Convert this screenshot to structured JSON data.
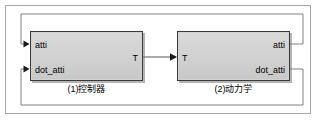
{
  "diagram": {
    "frame": {
      "border_color": "#a8a8a8",
      "background": "#ffffff"
    },
    "block_fill": "#d2d2d2",
    "block_border": "#3a3a3a",
    "line_color": "#808080",
    "signal_line_color": "#555555",
    "blocks": [
      {
        "id": "controller",
        "caption": "(1)控制器",
        "inputs": [
          {
            "name": "atti",
            "label": "atti"
          },
          {
            "name": "dot_atti",
            "label": "dot_atti"
          }
        ],
        "outputs": [
          {
            "name": "T",
            "label": "T"
          }
        ]
      },
      {
        "id": "dynamics",
        "caption": "(2)动力学",
        "inputs": [
          {
            "name": "T",
            "label": "T"
          }
        ],
        "outputs": [
          {
            "name": "atti",
            "label": "atti"
          },
          {
            "name": "dot_atti",
            "label": "dot_atti"
          }
        ]
      }
    ],
    "connections": [
      {
        "name": "torque-link",
        "from": "controller.T",
        "to": "dynamics.T",
        "label": ""
      },
      {
        "name": "atti-feedback",
        "from": "dynamics.atti",
        "to": "controller.atti",
        "label": ""
      },
      {
        "name": "dot-atti-feedback",
        "from": "dynamics.dot_atti",
        "to": "controller.dot_atti",
        "label": ""
      }
    ]
  }
}
